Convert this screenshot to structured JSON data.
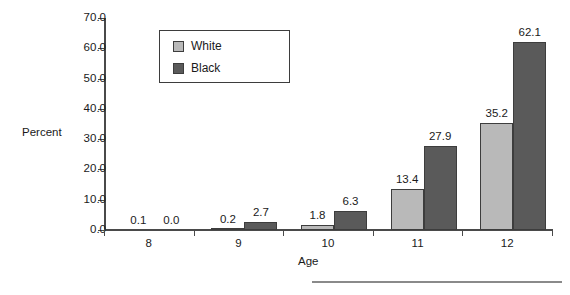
{
  "chart_data": {
    "type": "bar",
    "title": "",
    "xlabel": "Age",
    "ylabel": "Percent",
    "categories": [
      "8",
      "9",
      "10",
      "11",
      "12"
    ],
    "series": [
      {
        "name": "White",
        "color": "#b9b9b9",
        "values": [
          0.1,
          0.2,
          1.8,
          13.4,
          35.2
        ]
      },
      {
        "name": "Black",
        "color": "#5a5a5a",
        "values": [
          0.0,
          2.7,
          6.3,
          27.9,
          62.1
        ]
      }
    ],
    "value_labels": {
      "White": [
        "0.1",
        "0.2",
        "1.8",
        "13.4",
        "35.2"
      ],
      "Black": [
        "0.0",
        "2.7",
        "6.3",
        "27.9",
        "62.1"
      ]
    },
    "ylim": [
      0,
      70
    ],
    "ytick_labels": [
      "0.0",
      "10.0",
      "20.0",
      "30.0",
      "40.0",
      "50.0",
      "60.0",
      "70.0"
    ],
    "ytick_values": [
      0,
      10,
      20,
      30,
      40,
      50,
      60,
      70
    ],
    "grid": false,
    "legend_position": "upper-left-inside"
  },
  "axes": {
    "y_title": "Percent",
    "x_title": "Age"
  },
  "legend": {
    "items": [
      {
        "label": "White",
        "color": "#b9b9b9"
      },
      {
        "label": "Black",
        "color": "#5a5a5a"
      }
    ]
  },
  "colors": {
    "white_bar": "#b9b9b9",
    "black_bar": "#5a5a5a",
    "axis": "#4a4a4a",
    "bar_border": "#3d3d3d",
    "background": "#ffffff",
    "footer_rule": "#8a8a8a"
  }
}
